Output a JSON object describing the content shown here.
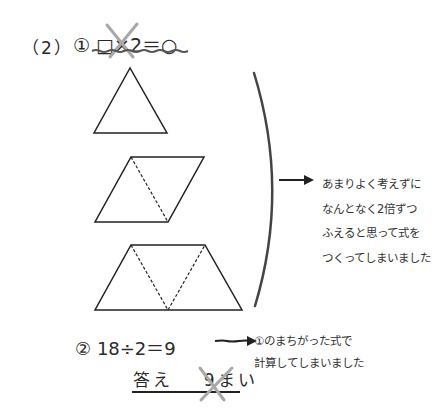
{
  "problem": {
    "number_label": "（2）",
    "step1": {
      "marker": "①",
      "equation": "□×2＝○",
      "crossed_out": true
    },
    "figures": [
      {
        "name": "triangle",
        "units": 1
      },
      {
        "name": "parallelogram",
        "units": 2
      },
      {
        "name": "trapezoid",
        "units": 3
      }
    ],
    "note1": {
      "lines": [
        "あまりよく考えずに",
        "なんとなく2倍ずつ",
        "ふえると思って式を",
        "つくってしまいました"
      ]
    },
    "step2": {
      "marker": "②",
      "equation": "18÷2＝9"
    },
    "note2": {
      "lines": [
        "①のまちがった式で",
        "計算してしまいました"
      ]
    },
    "answer": {
      "label": "答え",
      "value": "9まい",
      "crossed_out": true
    }
  },
  "colors": {
    "ink": "#2a2a2a",
    "cross": "#a8a8a8",
    "underline": "#555555"
  }
}
